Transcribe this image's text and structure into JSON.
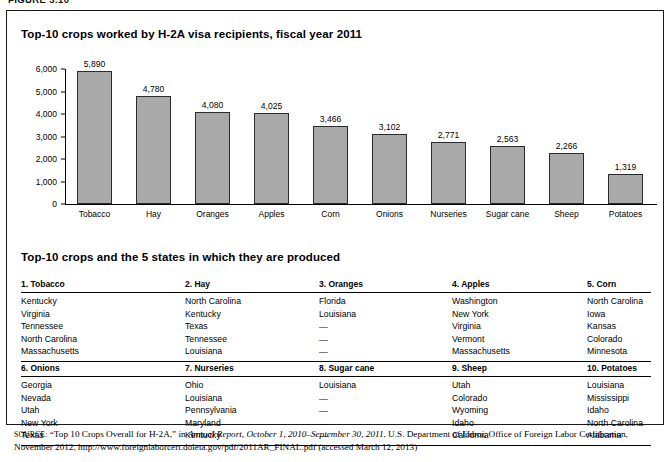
{
  "figure": {
    "label": "FIGURE 3.10"
  },
  "chart_panel": {
    "title": "Top-10 crops worked by H-2A visa recipients, fiscal year 2011"
  },
  "chart_data": {
    "type": "bar",
    "title": "Top-10 crops worked by H-2A visa recipients, fiscal year 2011",
    "categories": [
      "Tobacco",
      "Hay",
      "Oranges",
      "Apples",
      "Corn",
      "Onions",
      "Nurseries",
      "Sugar cane",
      "Sheep",
      "Potatoes"
    ],
    "values": [
      5890,
      4780,
      4080,
      4025,
      3466,
      3102,
      2771,
      2563,
      2266,
      1319
    ],
    "value_labels": [
      "5,890",
      "4,780",
      "4,080",
      "4,025",
      "3,466",
      "3,102",
      "2,771",
      "2,563",
      "2,266",
      "1,319"
    ],
    "xlabel": "",
    "ylabel": "",
    "ylim": [
      0,
      6000
    ],
    "yticks": [
      0,
      1000,
      2000,
      3000,
      4000,
      5000,
      6000
    ],
    "ytick_labels": [
      "0",
      "1,000",
      "2,000",
      "3,000",
      "4,000",
      "5,000",
      "6,000"
    ],
    "grid": false,
    "legend": "none",
    "bar_color": "#a9a9a9",
    "bar_border_color": "#2b2b2b"
  },
  "table_panel": {
    "title": "Top-10 crops and the 5 states in which they are produced",
    "block1": {
      "headers": [
        "1. Tobacco",
        "2. Hay",
        "3. Oranges",
        "4. Apples",
        "5. Corn"
      ],
      "rows": [
        [
          "Kentucky",
          "North Carolina",
          "Florida",
          "Washington",
          "North Carolina"
        ],
        [
          "Virginia",
          "Kentucky",
          "Louisiana",
          "New York",
          "Iowa"
        ],
        [
          "Tennessee",
          "Texas",
          "—",
          "Virginia",
          "Kansas"
        ],
        [
          "North Carolina",
          "Tennessee",
          "—",
          "Vermont",
          "Colorado"
        ],
        [
          "Massachusetts",
          "Louisiana",
          "—",
          "Massachusetts",
          "Minnesota"
        ]
      ]
    },
    "block2": {
      "headers": [
        "6. Onions",
        "7. Nurseries",
        "8. Sugar cane",
        "9. Sheep",
        "10. Potatoes"
      ],
      "rows": [
        [
          "Georgia",
          "Ohio",
          "Louisiana",
          "Utah",
          "Louisiana"
        ],
        [
          "Nevada",
          "Louisiana",
          "—",
          "Colorado",
          "Mississippi"
        ],
        [
          "Utah",
          "Pennsylvania",
          "—",
          "Wyoming",
          "Idaho"
        ],
        [
          "New York",
          "Maryland",
          "—",
          "Idaho",
          "North Carolina"
        ],
        [
          "Texas",
          "Kentucky",
          "—",
          "California",
          "Alabama"
        ]
      ]
    }
  },
  "source": {
    "label": "SOURCE:",
    "line": "“Top 10 Crops Overall for H-2A,” in ",
    "italic": "Annual Report, October 1, 2010–September 30, 2011",
    "after": ", U.S. Department of Labor, Office of Foreign Labor Certification, November 2012, http://www.foreignlaborcert.doleta.gov/pdf/2011AR_FINAL.pdf (accessed March 12, 2013)"
  }
}
